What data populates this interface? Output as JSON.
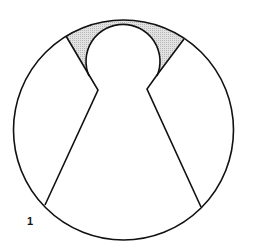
{
  "figure": {
    "label": "1",
    "colors": {
      "stroke": "#111111",
      "shaded_region": "#d0d0d0",
      "background": "#ffffff"
    },
    "shapes": {
      "outer_circle": {
        "cx": 123.5,
        "cy": 130,
        "r": 110
      },
      "head_circle": {
        "cx": 123,
        "cy": 61,
        "r": 37
      },
      "left_outline": [
        [
          66,
          36
        ],
        [
          89,
          75
        ],
        [
          98,
          90
        ],
        [
          45,
          205
        ]
      ],
      "right_outline": [
        [
          184,
          39
        ],
        [
          157,
          75
        ],
        [
          147,
          89
        ],
        [
          201,
          207
        ]
      ],
      "shaded_region": "area between outer circle top arc and head circle, bounded by shoulder lines"
    }
  }
}
